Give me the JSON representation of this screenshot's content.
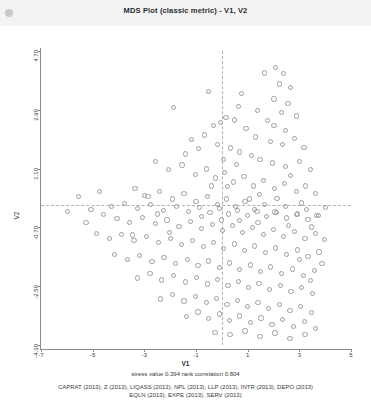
{
  "window": {
    "title": "MDS Plot (classic metric) - V1, V2",
    "dot_icon": "status-dot-icon"
  },
  "chart_data": {
    "type": "scatter",
    "title": "MDS Plot (classic metric) - V1, V2",
    "xlabel": "V1",
    "ylabel": "V2",
    "xlim": [
      -7,
      5
    ],
    "ylim": [
      -4.3,
      4.7
    ],
    "xticks": [
      "-7",
      "-5",
      "-3",
      "-1",
      "1",
      "3",
      "5"
    ],
    "xtick_values": [
      -7,
      -5,
      -3,
      -1,
      1,
      3,
      5
    ],
    "yticks": [
      "4.70",
      "2.90",
      "1.10",
      "-0.70",
      "-2.50",
      "-4.30"
    ],
    "ytick_values": [
      4.7,
      2.9,
      1.1,
      -0.7,
      -2.5,
      -4.3
    ],
    "grid": false,
    "reference_lines": {
      "horizontal": 0,
      "vertical": 0,
      "style": "dashed"
    },
    "legend": "none",
    "marker": "open-circle",
    "marker_color": "#9b9b9b",
    "points": [
      [
        -0.55,
        3.48
      ],
      [
        0.73,
        3.44
      ],
      [
        1.62,
        4.06
      ],
      [
        2.04,
        4.22
      ],
      [
        2.36,
        4.04
      ],
      [
        2.18,
        3.72
      ],
      [
        2.62,
        3.62
      ],
      [
        1.98,
        3.26
      ],
      [
        2.52,
        3.12
      ],
      [
        2.28,
        2.86
      ],
      [
        1.74,
        2.6
      ],
      [
        2.86,
        2.74
      ],
      [
        -1.92,
        3.0
      ],
      [
        -0.36,
        2.46
      ],
      [
        -0.08,
        2.54
      ],
      [
        0.12,
        2.7
      ],
      [
        0.46,
        2.62
      ],
      [
        0.9,
        2.36
      ],
      [
        1.26,
        2.1
      ],
      [
        1.86,
        1.96
      ],
      [
        2.3,
        1.88
      ],
      [
        2.78,
        2.06
      ],
      [
        3.14,
        1.78
      ],
      [
        -1.2,
        2.02
      ],
      [
        -0.7,
        2.16
      ],
      [
        -0.2,
        1.88
      ],
      [
        0.3,
        1.76
      ],
      [
        0.66,
        1.64
      ],
      [
        1.1,
        1.52
      ],
      [
        1.44,
        1.4
      ],
      [
        1.92,
        1.3
      ],
      [
        2.44,
        1.2
      ],
      [
        2.96,
        1.36
      ],
      [
        3.4,
        1.1
      ],
      [
        -2.6,
        1.34
      ],
      [
        -2.1,
        1.1
      ],
      [
        -1.58,
        1.24
      ],
      [
        -1.06,
        0.96
      ],
      [
        -0.62,
        1.12
      ],
      [
        -0.28,
        0.84
      ],
      [
        0.06,
        1.0
      ],
      [
        0.4,
        0.72
      ],
      [
        0.82,
        0.88
      ],
      [
        1.2,
        0.6
      ],
      [
        1.58,
        0.76
      ],
      [
        2.0,
        0.52
      ],
      [
        2.4,
        0.68
      ],
      [
        2.84,
        0.44
      ],
      [
        3.2,
        0.6
      ],
      [
        3.58,
        0.36
      ],
      [
        -3.4,
        0.52
      ],
      [
        -2.9,
        0.28
      ],
      [
        -2.44,
        0.44
      ],
      [
        -1.96,
        0.2
      ],
      [
        -1.5,
        0.36
      ],
      [
        -1.04,
        0.12
      ],
      [
        -0.6,
        0.28
      ],
      [
        -0.22,
        0.04
      ],
      [
        0.14,
        0.2
      ],
      [
        0.48,
        -0.04
      ],
      [
        0.86,
        0.12
      ],
      [
        1.24,
        -0.12
      ],
      [
        1.62,
        0.04
      ],
      [
        2.02,
        -0.2
      ],
      [
        2.42,
        -0.04
      ],
      [
        2.84,
        -0.28
      ],
      [
        3.24,
        -0.12
      ],
      [
        3.62,
        -0.3
      ],
      [
        3.96,
        -0.06
      ],
      [
        -4.3,
        -0.02
      ],
      [
        -3.8,
        0.06
      ],
      [
        -3.3,
        -0.1
      ],
      [
        -2.8,
        0.02
      ],
      [
        -2.3,
        -0.14
      ],
      [
        -1.8,
        -0.02
      ],
      [
        -1.34,
        -0.18
      ],
      [
        -0.9,
        -0.06
      ],
      [
        -0.5,
        -0.22
      ],
      [
        -0.14,
        -0.1
      ],
      [
        0.22,
        -0.26
      ],
      [
        0.58,
        -0.14
      ],
      [
        0.94,
        -0.3
      ],
      [
        1.32,
        -0.18
      ],
      [
        1.7,
        -0.34
      ],
      [
        2.08,
        -0.22
      ],
      [
        2.48,
        -0.38
      ],
      [
        2.88,
        -0.26
      ],
      [
        3.3,
        -0.42
      ],
      [
        3.7,
        -0.3
      ],
      [
        -5.1,
        -0.12
      ],
      [
        -4.62,
        -0.28
      ],
      [
        -4.1,
        -0.4
      ],
      [
        -3.6,
        -0.52
      ],
      [
        -3.1,
        -0.36
      ],
      [
        -2.62,
        -0.56
      ],
      [
        -2.16,
        -0.44
      ],
      [
        -1.7,
        -0.64
      ],
      [
        -1.26,
        -0.5
      ],
      [
        -0.82,
        -0.7
      ],
      [
        -0.4,
        -0.58
      ],
      [
        0.0,
        -0.76
      ],
      [
        0.38,
        -0.62
      ],
      [
        0.76,
        -0.82
      ],
      [
        1.16,
        -0.68
      ],
      [
        1.56,
        -0.88
      ],
      [
        1.96,
        -0.74
      ],
      [
        2.36,
        -0.94
      ],
      [
        2.78,
        -0.8
      ],
      [
        3.18,
        -1.0
      ],
      [
        3.58,
        -0.86
      ],
      [
        3.94,
        -1.04
      ],
      [
        -4.9,
        -0.86
      ],
      [
        -4.4,
        -1.0
      ],
      [
        -3.92,
        -0.88
      ],
      [
        -3.44,
        -1.08
      ],
      [
        -2.96,
        -0.94
      ],
      [
        -2.5,
        -1.14
      ],
      [
        -2.04,
        -1.0
      ],
      [
        -1.6,
        -1.2
      ],
      [
        -1.18,
        -1.06
      ],
      [
        -0.76,
        -1.26
      ],
      [
        -0.36,
        -1.12
      ],
      [
        0.04,
        -1.32
      ],
      [
        0.44,
        -1.18
      ],
      [
        0.84,
        -1.38
      ],
      [
        1.24,
        -1.24
      ],
      [
        1.64,
        -1.44
      ],
      [
        2.04,
        -1.3
      ],
      [
        2.46,
        -1.5
      ],
      [
        2.88,
        -1.36
      ],
      [
        3.3,
        -1.56
      ],
      [
        3.72,
        -1.42
      ],
      [
        -4.2,
        -1.5
      ],
      [
        -3.7,
        -1.64
      ],
      [
        -3.22,
        -1.52
      ],
      [
        -2.74,
        -1.72
      ],
      [
        -2.28,
        -1.58
      ],
      [
        -1.82,
        -1.78
      ],
      [
        -1.38,
        -1.64
      ],
      [
        -0.96,
        -1.84
      ],
      [
        -0.54,
        -1.7
      ],
      [
        -0.14,
        -1.9
      ],
      [
        0.26,
        -1.76
      ],
      [
        0.66,
        -1.96
      ],
      [
        1.06,
        -1.82
      ],
      [
        1.46,
        -2.02
      ],
      [
        1.86,
        -1.88
      ],
      [
        2.28,
        -2.08
      ],
      [
        2.7,
        -1.94
      ],
      [
        3.12,
        -2.14
      ],
      [
        3.54,
        -2.0
      ],
      [
        -3.3,
        -2.22
      ],
      [
        -2.82,
        -2.08
      ],
      [
        -2.36,
        -2.28
      ],
      [
        -1.9,
        -2.14
      ],
      [
        -1.46,
        -2.34
      ],
      [
        -1.02,
        -2.2
      ],
      [
        -0.6,
        -2.4
      ],
      [
        -0.2,
        -2.26
      ],
      [
        0.2,
        -2.46
      ],
      [
        0.6,
        -2.32
      ],
      [
        1.0,
        -2.52
      ],
      [
        1.4,
        -2.38
      ],
      [
        1.8,
        -2.58
      ],
      [
        2.22,
        -2.44
      ],
      [
        2.64,
        -2.64
      ],
      [
        3.06,
        -2.5
      ],
      [
        3.48,
        -2.7
      ],
      [
        -2.4,
        -2.86
      ],
      [
        -1.94,
        -2.72
      ],
      [
        -1.5,
        -2.92
      ],
      [
        -1.06,
        -2.78
      ],
      [
        -0.64,
        -2.98
      ],
      [
        -0.24,
        -2.84
      ],
      [
        0.16,
        -3.04
      ],
      [
        0.56,
        -2.9
      ],
      [
        0.96,
        -3.1
      ],
      [
        1.36,
        -2.96
      ],
      [
        1.76,
        -3.16
      ],
      [
        2.18,
        -3.02
      ],
      [
        2.6,
        -3.22
      ],
      [
        3.02,
        -3.08
      ],
      [
        3.44,
        -3.28
      ],
      [
        -1.4,
        -3.4
      ],
      [
        -0.96,
        -3.26
      ],
      [
        -0.54,
        -3.46
      ],
      [
        -0.14,
        -3.32
      ],
      [
        0.26,
        -3.52
      ],
      [
        0.66,
        -3.38
      ],
      [
        1.06,
        -3.58
      ],
      [
        1.48,
        -3.44
      ],
      [
        1.9,
        -3.64
      ],
      [
        2.32,
        -3.5
      ],
      [
        2.74,
        -3.7
      ],
      [
        3.16,
        -3.56
      ],
      [
        3.58,
        -3.76
      ],
      [
        -0.3,
        -3.88
      ],
      [
        0.28,
        -3.94
      ],
      [
        0.86,
        -3.84
      ],
      [
        1.44,
        -4.0
      ],
      [
        2.02,
        -3.9
      ],
      [
        2.6,
        -4.06
      ],
      [
        3.18,
        -3.96
      ],
      [
        -5.6,
        0.28
      ],
      [
        -5.3,
        -0.52
      ],
      [
        -4.78,
        0.42
      ],
      [
        -6.0,
        -0.18
      ],
      [
        -0.94,
        1.74
      ],
      [
        -1.44,
        1.58
      ],
      [
        0.04,
        1.42
      ],
      [
        0.52,
        1.26
      ],
      [
        1.02,
        0.2
      ],
      [
        1.42,
        0.34
      ],
      [
        0.18,
        0.58
      ],
      [
        -0.44,
        0.6
      ],
      [
        2.62,
        0.92
      ],
      [
        3.04,
        0.08
      ],
      [
        3.44,
        -0.66
      ],
      [
        3.84,
        -1.78
      ],
      [
        -2.06,
        -0.82
      ],
      [
        -2.54,
        -0.26
      ],
      [
        -3.02,
        0.3
      ],
      [
        -3.5,
        -0.9
      ],
      [
        1.98,
        2.44
      ],
      [
        2.42,
        2.3
      ],
      [
        0.62,
        3.02
      ],
      [
        1.34,
        2.92
      ],
      [
        -0.84,
        -0.34
      ],
      [
        -0.06,
        -0.44
      ],
      [
        0.66,
        -0.46
      ],
      [
        1.36,
        -0.52
      ],
      [
        2.1,
        0.22
      ],
      [
        2.54,
        -0.62
      ],
      [
        2.98,
        -1.64
      ],
      [
        3.38,
        -2.3
      ]
    ],
    "annotations": {
      "stress_label": "stress value",
      "stress_value": "0.394",
      "rank_label": "rank correlation",
      "rank_value": "0.804"
    }
  },
  "footer": {
    "stress_line": "stress value  0.394  rank correlation  0.804",
    "caption_line1": "CAPRAT (2013), Z (2013), LIQASS (2013), NPL (2013), LLP (2013), INTR (2013), DEPO (2013)",
    "caption_line2": "EQLN (2013), EXPE (2013), SERV (2013)"
  }
}
